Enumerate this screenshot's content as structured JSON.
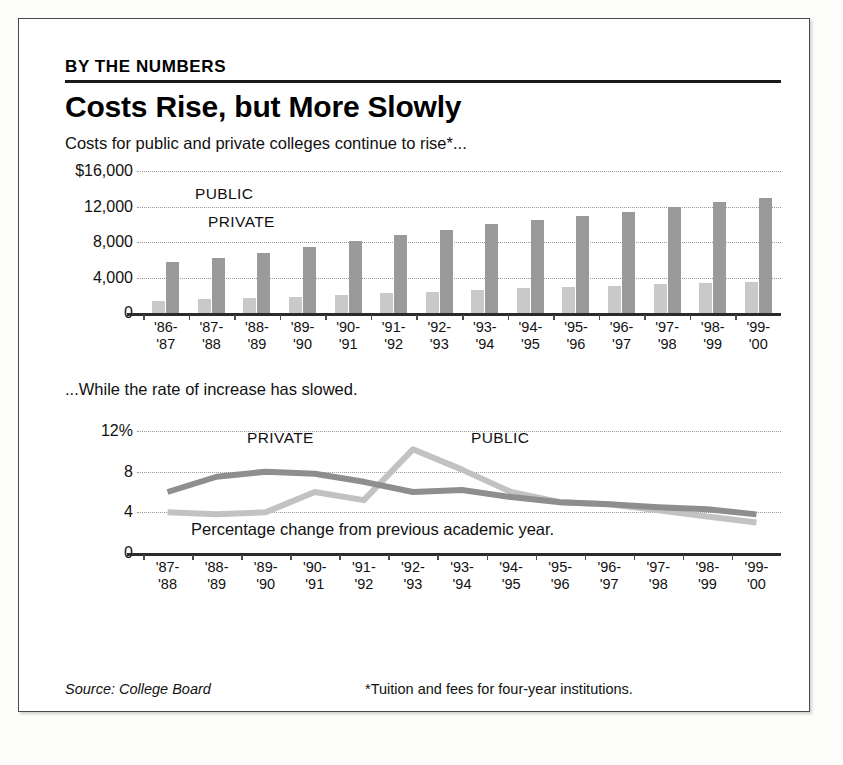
{
  "frame": {
    "kicker": "BY THE NUMBERS",
    "headline": "Costs Rise, but More Slowly",
    "deck": "Costs for public and private colleges continue to rise*...",
    "midnote": "...While the rate of increase has slowed.",
    "percent_note": "Percentage change from previous academic year.",
    "source": "Source: College Board",
    "footnote": "*Tuition and fees for four-year institutions."
  },
  "colors": {
    "public_bar": "#c9c9c9",
    "private_bar": "#9a9a9a",
    "public_line": "#c2c2c2",
    "private_line": "#8e8e8e",
    "axis": "#2b2b2b",
    "grid": "#9a9a9a"
  },
  "chart_data": [
    {
      "type": "bar",
      "id": "cost-bar-chart",
      "title": "Costs for public and private colleges continue to rise*...",
      "xlabel": "",
      "ylabel": "",
      "ylim": [
        0,
        16000
      ],
      "yticks": [
        0,
        4000,
        8000,
        12000,
        16000
      ],
      "ytick_labels": [
        "0",
        "4,000",
        "8,000",
        "12,000",
        "$16,000"
      ],
      "grid": true,
      "legend": [
        "PUBLIC",
        "PRIVATE"
      ],
      "legend_position": "inside-upper-left",
      "categories": [
        "'86-\n'87",
        "'87-\n'88",
        "'88-\n'89",
        "'89-\n'90",
        "'90-\n'91",
        "'91-\n'92",
        "'92-\n'93",
        "'93-\n'94",
        "'94-\n'95",
        "'95-\n'96",
        "'96-\n'97",
        "'97-\n'98",
        "'98-\n'99",
        "'99-\n'00"
      ],
      "series": [
        {
          "name": "PUBLIC",
          "color": "#c9c9c9",
          "values": [
            1400,
            1550,
            1650,
            1800,
            2000,
            2200,
            2400,
            2600,
            2800,
            2950,
            3100,
            3250,
            3350,
            3450
          ]
        },
        {
          "name": "PRIVATE",
          "color": "#9a9a9a",
          "values": [
            5800,
            6200,
            6800,
            7400,
            8100,
            8800,
            9400,
            10000,
            10500,
            10900,
            11400,
            12000,
            12500,
            13000
          ]
        }
      ]
    },
    {
      "type": "line",
      "id": "rate-line-chart",
      "title": "...While the rate of increase has slowed.",
      "xlabel": "",
      "ylabel": "",
      "ylim": [
        0,
        12
      ],
      "yticks": [
        0,
        4,
        8,
        12
      ],
      "ytick_labels": [
        "0",
        "4",
        "8",
        "12%"
      ],
      "grid": true,
      "legend": [
        "PRIVATE",
        "PUBLIC"
      ],
      "annotation": "Percentage change from previous academic year.",
      "categories": [
        "'87-\n'88",
        "'88-\n'89",
        "'89-\n'90",
        "'90-\n'91",
        "'91-\n'92",
        "'92-\n'93",
        "'93-\n'94",
        "'94-\n'95",
        "'95-\n'96",
        "'96-\n'97",
        "'97-\n'98",
        "'98-\n'99",
        "'99-\n'00"
      ],
      "series": [
        {
          "name": "PRIVATE",
          "color": "#8e8e8e",
          "values": [
            6.0,
            7.5,
            8.0,
            7.8,
            7.0,
            6.0,
            6.2,
            5.5,
            5.0,
            4.8,
            4.5,
            4.3,
            3.8
          ]
        },
        {
          "name": "PUBLIC",
          "color": "#c2c2c2",
          "values": [
            4.0,
            3.8,
            4.0,
            6.0,
            5.2,
            10.2,
            8.2,
            6.0,
            5.0,
            4.8,
            4.2,
            3.6,
            3.0
          ]
        }
      ]
    }
  ]
}
